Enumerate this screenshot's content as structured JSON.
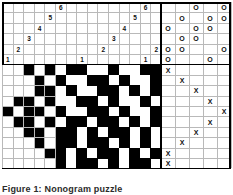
{
  "puzzle": {
    "title_caption": "Figure 1: Nonogram puzzle",
    "type": "nonogram-grid",
    "colors": {
      "filled": "#000000",
      "empty": "#ffffff",
      "gridline": "#b9b9b9",
      "border": "#000000",
      "text": "#111111"
    },
    "geometry": {
      "cols": 19,
      "clue_rows": 6,
      "grid_rows": 10,
      "cell_w": 10.6,
      "cell_h": 10.4,
      "left": 2,
      "top": 2,
      "main_split_col": 15
    }
  },
  "clue_panel": {
    "label": "clue-header",
    "rows": 6,
    "cols": 15,
    "numbers": [
      {
        "row": 0,
        "col": 5,
        "value": "6"
      },
      {
        "row": 0,
        "col": 13,
        "value": "6"
      },
      {
        "row": 1,
        "col": 4,
        "value": "5"
      },
      {
        "row": 1,
        "col": 12,
        "value": "5"
      },
      {
        "row": 2,
        "col": 3,
        "value": "4"
      },
      {
        "row": 2,
        "col": 11,
        "value": "4"
      },
      {
        "row": 3,
        "col": 2,
        "value": "3"
      },
      {
        "row": 3,
        "col": 10,
        "value": "3"
      },
      {
        "row": 4,
        "col": 1,
        "value": "2"
      },
      {
        "row": 4,
        "col": 9,
        "value": "2"
      },
      {
        "row": 4,
        "col": 14,
        "value": "2"
      },
      {
        "row": 5,
        "col": 0,
        "value": "1"
      },
      {
        "row": 5,
        "col": 7,
        "value": "1"
      },
      {
        "row": 5,
        "col": 13,
        "value": "1"
      }
    ]
  },
  "o_panel": {
    "label": "o-marker-panel",
    "rows": 6,
    "cols": 4,
    "glyph": "O",
    "marks": [
      {
        "row": 0,
        "col": 2
      },
      {
        "row": 0,
        "col": 4
      },
      {
        "row": 1,
        "col": 1
      },
      {
        "row": 1,
        "col": 3
      },
      {
        "row": 1,
        "col": 4
      },
      {
        "row": 2,
        "col": 0
      },
      {
        "row": 2,
        "col": 2
      },
      {
        "row": 2,
        "col": 3
      },
      {
        "row": 3,
        "col": 1
      },
      {
        "row": 3,
        "col": 2
      },
      {
        "row": 4,
        "col": 0
      },
      {
        "row": 4,
        "col": 1
      },
      {
        "row": 4,
        "col": 4
      },
      {
        "row": 5,
        "col": 0
      },
      {
        "row": 5,
        "col": 3
      }
    ]
  },
  "x_panel": {
    "label": "x-marker-panel",
    "rows": 10,
    "cols": 5,
    "glyph": "X",
    "marks": [
      {
        "row": 0,
        "col": 0
      },
      {
        "row": 1,
        "col": 1
      },
      {
        "row": 2,
        "col": 2
      },
      {
        "row": 3,
        "col": 3
      },
      {
        "row": 4,
        "col": 4
      },
      {
        "row": 5,
        "col": 3
      },
      {
        "row": 6,
        "col": 2
      },
      {
        "row": 7,
        "col": 1
      },
      {
        "row": 8,
        "col": 0
      },
      {
        "row": 9,
        "col": 0
      }
    ]
  },
  "main_grid": {
    "label": "nonogram-solution-grid",
    "rows": 10,
    "cols": 15,
    "legend": {
      "1": "filled-black",
      "0": "empty-white",
      "x": "outside-blank"
    },
    "matrix": [
      "xxxx1011011010111",
      "xxxx0100110101011",
      "xxx11011001011010",
      "x1100101101001101",
      "1001011010110100x",
      "x1101001011010011",
      "xx0110110100110x1",
      "xxx1011011010101x",
      "xxxx110100110101x",
      "xxxxx101101011011"
    ],
    "rows_data": [
      {
        "r": 0,
        "cells": "0000000001101101001101011011"
      },
      {
        "r": 1,
        "cells": ""
      }
    ]
  },
  "grid_runs": {
    "note": "per-row list of [startCol,endColInclusive] black runs, 15 columns wide",
    "rows": [
      {
        "row": 0,
        "blanks": [
          [
            0,
            1
          ]
        ],
        "black": [
          [
            2,
            2
          ],
          [
            4,
            4
          ],
          [
            6,
            7
          ],
          [
            10,
            10
          ],
          [
            13,
            14
          ]
        ]
      },
      {
        "row": 1,
        "blanks": [
          [
            0,
            1
          ]
        ],
        "black": [
          [
            3,
            3
          ],
          [
            5,
            5
          ],
          [
            8,
            9
          ],
          [
            11,
            11
          ],
          [
            14,
            14
          ]
        ]
      },
      {
        "row": 2,
        "blanks": [
          [
            0,
            2
          ]
        ],
        "black": [
          [
            3,
            4
          ],
          [
            6,
            6
          ],
          [
            9,
            10
          ],
          [
            12,
            12
          ],
          [
            14,
            14
          ]
        ]
      },
      {
        "row": 3,
        "blanks": [
          [
            0,
            0
          ]
        ],
        "black": [
          [
            1,
            2
          ],
          [
            4,
            4
          ],
          [
            7,
            8
          ],
          [
            10,
            10
          ],
          [
            13,
            13
          ]
        ]
      },
      {
        "row": 4,
        "blanks": [],
        "black": [
          [
            0,
            0
          ],
          [
            2,
            3
          ],
          [
            5,
            5
          ],
          [
            8,
            9
          ],
          [
            11,
            11
          ],
          [
            14,
            14
          ]
        ]
      },
      {
        "row": 5,
        "blanks": [
          [
            0,
            0
          ]
        ],
        "black": [
          [
            1,
            2
          ],
          [
            4,
            4
          ],
          [
            6,
            7
          ],
          [
            9,
            10
          ],
          [
            12,
            12
          ],
          [
            14,
            14
          ]
        ]
      },
      {
        "row": 6,
        "blanks": [
          [
            0,
            1
          ]
        ],
        "black": [
          [
            2,
            3
          ],
          [
            5,
            6
          ],
          [
            8,
            8
          ],
          [
            10,
            11
          ],
          [
            13,
            13
          ]
        ]
      },
      {
        "row": 7,
        "blanks": [
          [
            0,
            2
          ]
        ],
        "black": [
          [
            3,
            3
          ],
          [
            5,
            6
          ],
          [
            8,
            9
          ],
          [
            11,
            11
          ],
          [
            13,
            13
          ]
        ]
      },
      {
        "row": 8,
        "blanks": [
          [
            0,
            3
          ]
        ],
        "black": [
          [
            4,
            5
          ],
          [
            7,
            7
          ],
          [
            9,
            10
          ],
          [
            12,
            12
          ],
          [
            14,
            14
          ]
        ]
      },
      {
        "row": 9,
        "blanks": [
          [
            0,
            4
          ]
        ],
        "black": [
          [
            5,
            5
          ],
          [
            7,
            8
          ],
          [
            10,
            10
          ],
          [
            12,
            13
          ]
        ]
      }
    ]
  }
}
